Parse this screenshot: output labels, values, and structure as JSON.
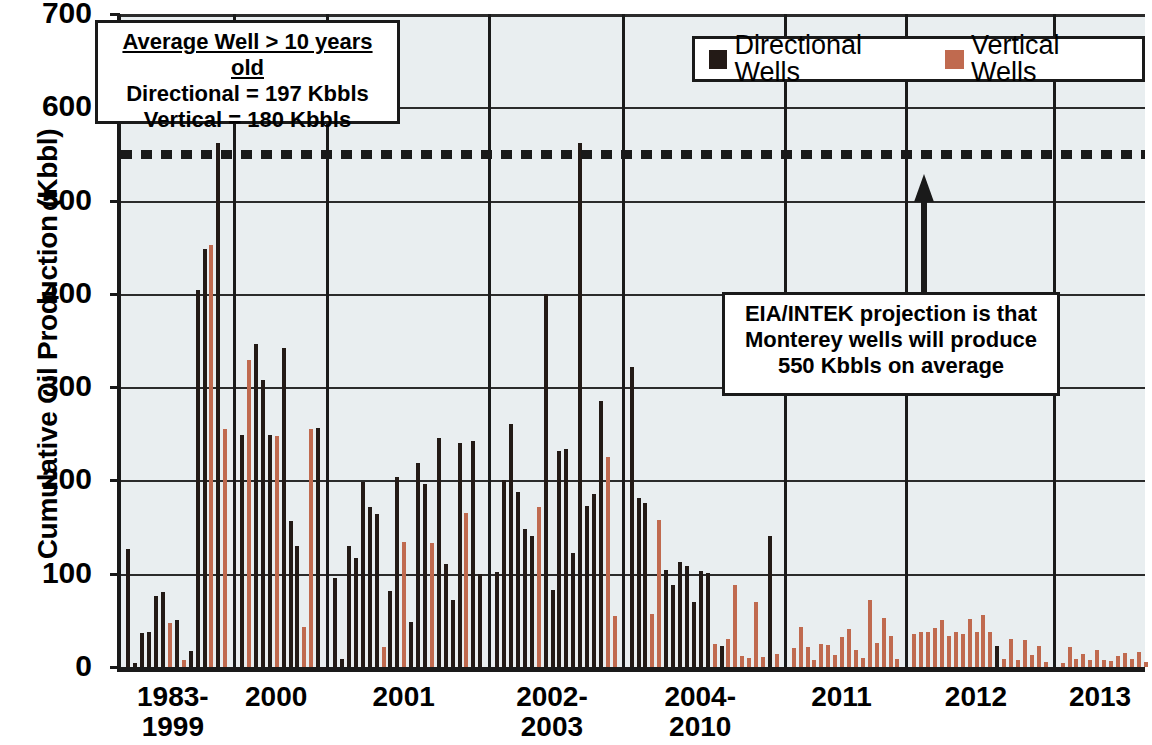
{
  "chart_data": {
    "type": "bar",
    "title": "",
    "xlabel": "",
    "ylabel": "Cumulative Oil Production (Kbbl)",
    "ylim": [
      0,
      700
    ],
    "ytick_labels": [
      "0",
      "100",
      "200",
      "300",
      "400",
      "500",
      "600",
      "700"
    ],
    "ytick_values": [
      0,
      100,
      200,
      300,
      400,
      500,
      600,
      700
    ],
    "grid": "horizontal",
    "legend_position": "top-right",
    "categories": [
      "1983-1999",
      "2000",
      "2001",
      "2002-2003",
      "2004-2010",
      "2011",
      "2012",
      "2013"
    ],
    "series": [
      {
        "name": "Directional Wells",
        "color": "#231a16"
      },
      {
        "name": "Vertical Wells",
        "color": "#c06a4f"
      }
    ],
    "threshold": {
      "value": 550,
      "label": "550 Kbbls on average",
      "style": "dotted",
      "color": "#1a1a1a"
    },
    "groups": [
      {
        "category": "1983-1999",
        "bars": [
          {
            "series": "Directional Wells",
            "value": 127
          },
          {
            "series": "Directional Wells",
            "value": 4
          },
          {
            "series": "Directional Wells",
            "value": 36
          },
          {
            "series": "Directional Wells",
            "value": 38
          },
          {
            "series": "Directional Wells",
            "value": 76
          },
          {
            "series": "Directional Wells",
            "value": 80
          },
          {
            "series": "Vertical Wells",
            "value": 47
          },
          {
            "series": "Directional Wells",
            "value": 50
          },
          {
            "series": "Vertical Wells",
            "value": 8
          },
          {
            "series": "Directional Wells",
            "value": 17
          },
          {
            "series": "Directional Wells",
            "value": 404
          },
          {
            "series": "Directional Wells",
            "value": 448
          },
          {
            "series": "Vertical Wells",
            "value": 452
          },
          {
            "series": "Directional Wells",
            "value": 562
          },
          {
            "series": "Vertical Wells",
            "value": 255
          }
        ]
      },
      {
        "category": "2000",
        "bars": [
          {
            "series": "Directional Wells",
            "value": 249
          },
          {
            "series": "Vertical Wells",
            "value": 329
          },
          {
            "series": "Directional Wells",
            "value": 346
          },
          {
            "series": "Directional Wells",
            "value": 308
          },
          {
            "series": "Directional Wells",
            "value": 249
          },
          {
            "series": "Vertical Wells",
            "value": 248
          },
          {
            "series": "Directional Wells",
            "value": 342
          },
          {
            "series": "Directional Wells",
            "value": 157
          },
          {
            "series": "Directional Wells",
            "value": 130
          },
          {
            "series": "Vertical Wells",
            "value": 43
          },
          {
            "series": "Vertical Wells",
            "value": 255
          },
          {
            "series": "Directional Wells",
            "value": 256
          }
        ]
      },
      {
        "category": "2001",
        "bars": [
          {
            "series": "Directional Wells",
            "value": 95
          },
          {
            "series": "Directional Wells",
            "value": 9
          },
          {
            "series": "Directional Wells",
            "value": 130
          },
          {
            "series": "Directional Wells",
            "value": 117
          },
          {
            "series": "Directional Wells",
            "value": 198
          },
          {
            "series": "Directional Wells",
            "value": 172
          },
          {
            "series": "Directional Wells",
            "value": 164
          },
          {
            "series": "Vertical Wells",
            "value": 21
          },
          {
            "series": "Directional Wells",
            "value": 82
          },
          {
            "series": "Directional Wells",
            "value": 204
          },
          {
            "series": "Vertical Wells",
            "value": 134
          },
          {
            "series": "Directional Wells",
            "value": 48
          },
          {
            "series": "Directional Wells",
            "value": 219
          },
          {
            "series": "Directional Wells",
            "value": 196
          },
          {
            "series": "Vertical Wells",
            "value": 133
          },
          {
            "series": "Directional Wells",
            "value": 246
          },
          {
            "series": "Directional Wells",
            "value": 110
          },
          {
            "series": "Directional Wells",
            "value": 72
          },
          {
            "series": "Directional Wells",
            "value": 240
          },
          {
            "series": "Vertical Wells",
            "value": 165
          },
          {
            "series": "Directional Wells",
            "value": 242
          },
          {
            "series": "Directional Wells",
            "value": 100
          }
        ]
      },
      {
        "category": "2002-2003",
        "bars": [
          {
            "series": "Directional Wells",
            "value": 102
          },
          {
            "series": "Directional Wells",
            "value": 200
          },
          {
            "series": "Directional Wells",
            "value": 260
          },
          {
            "series": "Directional Wells",
            "value": 188
          },
          {
            "series": "Directional Wells",
            "value": 148
          },
          {
            "series": "Directional Wells",
            "value": 140
          },
          {
            "series": "Vertical Wells",
            "value": 172
          },
          {
            "series": "Directional Wells",
            "value": 400
          },
          {
            "series": "Directional Wells",
            "value": 83
          },
          {
            "series": "Directional Wells",
            "value": 232
          },
          {
            "series": "Directional Wells",
            "value": 234
          },
          {
            "series": "Directional Wells",
            "value": 122
          },
          {
            "series": "Directional Wells",
            "value": 562
          },
          {
            "series": "Directional Wells",
            "value": 173
          },
          {
            "series": "Directional Wells",
            "value": 186
          },
          {
            "series": "Directional Wells",
            "value": 285
          },
          {
            "series": "Vertical Wells",
            "value": 225
          },
          {
            "series": "Vertical Wells",
            "value": 55
          }
        ]
      },
      {
        "category": "2004-2010",
        "bars": [
          {
            "series": "Directional Wells",
            "value": 322
          },
          {
            "series": "Directional Wells",
            "value": 181
          },
          {
            "series": "Directional Wells",
            "value": 176
          },
          {
            "series": "Vertical Wells",
            "value": 57
          },
          {
            "series": "Vertical Wells",
            "value": 158
          },
          {
            "series": "Directional Wells",
            "value": 104
          },
          {
            "series": "Directional Wells",
            "value": 88
          },
          {
            "series": "Directional Wells",
            "value": 113
          },
          {
            "series": "Directional Wells",
            "value": 108
          },
          {
            "series": "Directional Wells",
            "value": 70
          },
          {
            "series": "Directional Wells",
            "value": 103
          },
          {
            "series": "Directional Wells",
            "value": 101
          },
          {
            "series": "Vertical Wells",
            "value": 25
          },
          {
            "series": "Directional Wells",
            "value": 23
          },
          {
            "series": "Vertical Wells",
            "value": 30
          },
          {
            "series": "Vertical Wells",
            "value": 88
          },
          {
            "series": "Vertical Wells",
            "value": 12
          },
          {
            "series": "Vertical Wells",
            "value": 10
          },
          {
            "series": "Vertical Wells",
            "value": 70
          },
          {
            "series": "Vertical Wells",
            "value": 11
          },
          {
            "series": "Directional Wells",
            "value": 140
          },
          {
            "series": "Vertical Wells",
            "value": 14
          }
        ]
      },
      {
        "category": "2011",
        "bars": [
          {
            "series": "Vertical Wells",
            "value": 20
          },
          {
            "series": "Vertical Wells",
            "value": 43
          },
          {
            "series": "Vertical Wells",
            "value": 21
          },
          {
            "series": "Vertical Wells",
            "value": 8
          },
          {
            "series": "Vertical Wells",
            "value": 25
          },
          {
            "series": "Vertical Wells",
            "value": 24
          },
          {
            "series": "Vertical Wells",
            "value": 13
          },
          {
            "series": "Vertical Wells",
            "value": 32
          },
          {
            "series": "Vertical Wells",
            "value": 41
          },
          {
            "series": "Vertical Wells",
            "value": 18
          },
          {
            "series": "Vertical Wells",
            "value": 10
          },
          {
            "series": "Vertical Wells",
            "value": 72
          },
          {
            "series": "Vertical Wells",
            "value": 26
          },
          {
            "series": "Vertical Wells",
            "value": 53
          },
          {
            "series": "Vertical Wells",
            "value": 33
          },
          {
            "series": "Vertical Wells",
            "value": 9
          }
        ]
      },
      {
        "category": "2012",
        "bars": [
          {
            "series": "Vertical Wells",
            "value": 35
          },
          {
            "series": "Vertical Wells",
            "value": 38
          },
          {
            "series": "Vertical Wells",
            "value": 38
          },
          {
            "series": "Vertical Wells",
            "value": 42
          },
          {
            "series": "Vertical Wells",
            "value": 50
          },
          {
            "series": "Vertical Wells",
            "value": 33
          },
          {
            "series": "Vertical Wells",
            "value": 37
          },
          {
            "series": "Vertical Wells",
            "value": 35
          },
          {
            "series": "Vertical Wells",
            "value": 51
          },
          {
            "series": "Vertical Wells",
            "value": 38
          },
          {
            "series": "Vertical Wells",
            "value": 56
          },
          {
            "series": "Vertical Wells",
            "value": 38
          },
          {
            "series": "Directional Wells",
            "value": 23
          },
          {
            "series": "Vertical Wells",
            "value": 9
          },
          {
            "series": "Vertical Wells",
            "value": 30
          },
          {
            "series": "Vertical Wells",
            "value": 8
          },
          {
            "series": "Vertical Wells",
            "value": 29
          },
          {
            "series": "Vertical Wells",
            "value": 13
          },
          {
            "series": "Vertical Wells",
            "value": 22
          },
          {
            "series": "Vertical Wells",
            "value": 5
          }
        ]
      },
      {
        "category": "2013",
        "bars": [
          {
            "series": "Vertical Wells",
            "value": 4
          },
          {
            "series": "Vertical Wells",
            "value": 21
          },
          {
            "series": "Vertical Wells",
            "value": 9
          },
          {
            "series": "Vertical Wells",
            "value": 14
          },
          {
            "series": "Vertical Wells",
            "value": 8
          },
          {
            "series": "Vertical Wells",
            "value": 18
          },
          {
            "series": "Vertical Wells",
            "value": 7
          },
          {
            "series": "Vertical Wells",
            "value": 6
          },
          {
            "series": "Vertical Wells",
            "value": 12
          },
          {
            "series": "Vertical Wells",
            "value": 15
          },
          {
            "series": "Vertical Wells",
            "value": 9
          },
          {
            "series": "Vertical Wells",
            "value": 16
          },
          {
            "series": "Vertical Wells",
            "value": 5
          }
        ]
      }
    ]
  },
  "legend": {
    "entries": [
      {
        "label": "Directional Wells",
        "color": "#231a16"
      },
      {
        "label": "Vertical Wells",
        "color": "#c06a4f"
      }
    ]
  },
  "callouts": {
    "average_well": {
      "heading": "Average Well > 10 years old",
      "line2": "Directional = 197 Kbbls",
      "line3": "Vertical = 180 Kbbls"
    },
    "projection": {
      "line1": "EIA/INTEK projection is that",
      "line2": "Monterey wells will produce",
      "line3": "550 Kbbls on average"
    }
  }
}
